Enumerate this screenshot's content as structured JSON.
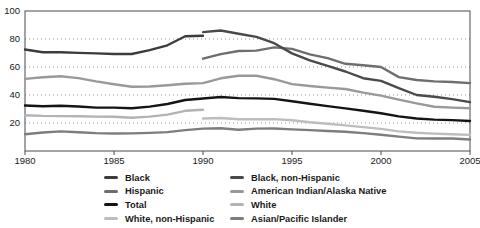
{
  "chart_data": {
    "type": "line",
    "title": "",
    "xlabel": "",
    "ylabel": "",
    "xlim": [
      1980,
      2005
    ],
    "ylim": [
      0,
      100
    ],
    "x_ticks": [
      1980,
      1985,
      1990,
      1995,
      2000,
      2005
    ],
    "y_ticks": [
      20,
      40,
      60,
      80,
      100
    ],
    "grid": "horizontal dotted at 20/40/60/80, full plot frame box",
    "legend_position": "bottom, two columns",
    "series": [
      {
        "name": "White, non-Hispanic",
        "color": "#bdbdbd",
        "points": [
          [
            1990,
            23.2
          ],
          [
            1991,
            23.6
          ],
          [
            1992,
            22.7
          ],
          [
            1993,
            22.7
          ],
          [
            1994,
            22.8
          ],
          [
            1995,
            22.0
          ],
          [
            1996,
            20.6
          ],
          [
            1997,
            19.4
          ],
          [
            1998,
            18.3
          ],
          [
            1999,
            17.1
          ],
          [
            2000,
            15.8
          ],
          [
            2001,
            14.0
          ],
          [
            2002,
            13.1
          ],
          [
            2003,
            12.4
          ],
          [
            2004,
            12.0
          ],
          [
            2005,
            11.5
          ]
        ]
      },
      {
        "name": "White",
        "color": "#b3b3b3",
        "points": [
          [
            1980,
            25.5
          ],
          [
            1981,
            25.1
          ],
          [
            1982,
            24.9
          ],
          [
            1983,
            24.8
          ],
          [
            1984,
            24.6
          ],
          [
            1985,
            24.4
          ],
          [
            1986,
            23.8
          ],
          [
            1987,
            24.6
          ],
          [
            1988,
            26.0
          ],
          [
            1989,
            28.7
          ],
          [
            1990,
            29.5
          ]
        ]
      },
      {
        "name": "American Indian/Alaska Native",
        "color": "#999999",
        "points": [
          [
            1980,
            51.5
          ],
          [
            1981,
            52.7
          ],
          [
            1982,
            53.4
          ],
          [
            1983,
            52.1
          ],
          [
            1984,
            49.7
          ],
          [
            1985,
            47.7
          ],
          [
            1986,
            45.9
          ],
          [
            1987,
            46.1
          ],
          [
            1988,
            47.0
          ],
          [
            1989,
            48.0
          ],
          [
            1990,
            48.5
          ],
          [
            1991,
            51.9
          ],
          [
            1992,
            53.8
          ],
          [
            1993,
            53.7
          ],
          [
            1994,
            51.3
          ],
          [
            1995,
            47.8
          ],
          [
            1996,
            46.4
          ],
          [
            1997,
            45.3
          ],
          [
            1998,
            44.3
          ],
          [
            1999,
            41.7
          ],
          [
            2000,
            39.6
          ],
          [
            2001,
            36.7
          ],
          [
            2002,
            34.1
          ],
          [
            2003,
            31.6
          ],
          [
            2004,
            31.0
          ],
          [
            2005,
            30.5
          ]
        ]
      },
      {
        "name": "Asian/Pacific Islander",
        "color": "#7d7d7d",
        "points": [
          [
            1980,
            12.0
          ],
          [
            1981,
            13.2
          ],
          [
            1982,
            14.0
          ],
          [
            1983,
            13.4
          ],
          [
            1984,
            12.8
          ],
          [
            1985,
            12.5
          ],
          [
            1986,
            12.6
          ],
          [
            1987,
            12.9
          ],
          [
            1988,
            13.5
          ],
          [
            1989,
            14.9
          ],
          [
            1990,
            16.0
          ],
          [
            1991,
            16.3
          ],
          [
            1992,
            15.2
          ],
          [
            1993,
            16.0
          ],
          [
            1994,
            16.1
          ],
          [
            1995,
            15.4
          ],
          [
            1996,
            14.9
          ],
          [
            1997,
            14.3
          ],
          [
            1998,
            13.8
          ],
          [
            1999,
            12.8
          ],
          [
            2000,
            11.6
          ],
          [
            2001,
            10.3
          ],
          [
            2002,
            9.0
          ],
          [
            2003,
            8.9
          ],
          [
            2004,
            8.9
          ],
          [
            2005,
            8.2
          ]
        ]
      },
      {
        "name": "Hispanic",
        "color": "#6e6e6e",
        "points": [
          [
            1990,
            65.9
          ],
          [
            1991,
            69.2
          ],
          [
            1992,
            71.4
          ],
          [
            1993,
            71.7
          ],
          [
            1994,
            74.0
          ],
          [
            1995,
            72.9
          ],
          [
            1996,
            69.0
          ],
          [
            1997,
            66.3
          ],
          [
            1998,
            62.3
          ],
          [
            1999,
            61.3
          ],
          [
            2000,
            60.0
          ],
          [
            2001,
            52.8
          ],
          [
            2002,
            50.7
          ],
          [
            2003,
            49.7
          ],
          [
            2004,
            49.3
          ],
          [
            2005,
            48.5
          ]
        ]
      },
      {
        "name": "Black, non-Hispanic",
        "color": "#4a4a4a",
        "points": [
          [
            1990,
            84.9
          ],
          [
            1991,
            86.1
          ],
          [
            1992,
            83.8
          ],
          [
            1993,
            81.5
          ],
          [
            1994,
            77.0
          ],
          [
            1995,
            69.7
          ],
          [
            1996,
            64.7
          ],
          [
            1997,
            60.8
          ],
          [
            1998,
            56.8
          ],
          [
            1999,
            52.0
          ],
          [
            2000,
            50.1
          ],
          [
            2001,
            44.9
          ],
          [
            2002,
            40.0
          ],
          [
            2003,
            38.7
          ],
          [
            2004,
            37.1
          ],
          [
            2005,
            34.9
          ]
        ]
      },
      {
        "name": "Black",
        "color": "#3c3c3c",
        "points": [
          [
            1980,
            72.5
          ],
          [
            1981,
            70.6
          ],
          [
            1982,
            70.5
          ],
          [
            1983,
            70.1
          ],
          [
            1984,
            69.7
          ],
          [
            1985,
            69.3
          ],
          [
            1986,
            69.3
          ],
          [
            1987,
            72.1
          ],
          [
            1988,
            75.5
          ],
          [
            1989,
            81.9
          ],
          [
            1990,
            82.3
          ]
        ]
      },
      {
        "name": "Total",
        "color": "#141414",
        "points": [
          [
            1980,
            32.5
          ],
          [
            1981,
            32.0
          ],
          [
            1982,
            32.3
          ],
          [
            1983,
            31.8
          ],
          [
            1984,
            31.0
          ],
          [
            1985,
            31.0
          ],
          [
            1986,
            30.5
          ],
          [
            1987,
            31.7
          ],
          [
            1988,
            33.6
          ],
          [
            1989,
            36.4
          ],
          [
            1990,
            37.5
          ],
          [
            1991,
            38.6
          ],
          [
            1992,
            37.8
          ],
          [
            1993,
            37.6
          ],
          [
            1994,
            37.2
          ],
          [
            1995,
            35.5
          ],
          [
            1996,
            33.8
          ],
          [
            1997,
            32.1
          ],
          [
            1998,
            30.4
          ],
          [
            1999,
            28.7
          ],
          [
            2000,
            26.9
          ],
          [
            2001,
            24.7
          ],
          [
            2002,
            23.2
          ],
          [
            2003,
            22.4
          ],
          [
            2004,
            22.1
          ],
          [
            2005,
            21.4
          ]
        ]
      }
    ],
    "legend_columns": [
      [
        "Black",
        "Hispanic",
        "Total",
        "White, non-Hispanic"
      ],
      [
        "Black, non-Hispanic",
        "American Indian/Alaska Native",
        "White",
        "Asian/Pacific Islander"
      ]
    ]
  },
  "style": {
    "frame_color": "#4a4a4a",
    "grid_color": "#8f8f8f",
    "label_color": "#1a1a1a"
  }
}
